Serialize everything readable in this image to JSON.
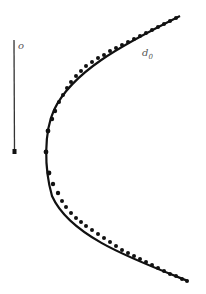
{
  "figure": {
    "labels": {
      "o": "o",
      "d_main": "d",
      "d_sub": "0"
    },
    "colors": {
      "ink": "#111111",
      "label": "#555555",
      "background": "#ffffff"
    },
    "axis_line": {
      "x": 14,
      "y_top": 40,
      "y_bottom": 153
    },
    "curve": {
      "shape": "parabola-like trajectory opening right",
      "vertex": [
        45,
        152
      ],
      "top_end": [
        180,
        16
      ],
      "bottom_end": [
        188,
        281
      ]
    }
  }
}
